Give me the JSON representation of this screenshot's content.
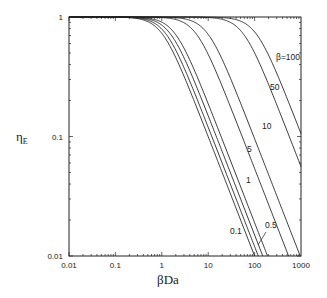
{
  "chart_data": {
    "type": "line",
    "title": "",
    "xlabel": "βDa",
    "ylabel": "ηE",
    "xscale": "log",
    "yscale": "log",
    "xlim": [
      0.01,
      1000
    ],
    "ylim": [
      0.01,
      1
    ],
    "x_ticks": [
      "0.01",
      "0.1",
      "1",
      "10",
      "100",
      "1000"
    ],
    "y_ticks": [
      "0.01",
      "0.1",
      "1"
    ],
    "grid": false,
    "legend": "inline curve labels",
    "series": [
      {
        "name": "β=0.1",
        "label": "0.1",
        "asymptote_C": 1.0,
        "points": [
          [
            0.01,
            1.0
          ],
          [
            0.1,
            0.99
          ],
          [
            1,
            0.62
          ],
          [
            10,
            0.1
          ],
          [
            100,
            0.01
          ]
        ]
      },
      {
        "name": "β=0.3",
        "label": "",
        "asymptote_C": 1.2,
        "points": [
          [
            0.01,
            1.0
          ],
          [
            0.1,
            0.99
          ],
          [
            1,
            0.68
          ],
          [
            10,
            0.12
          ],
          [
            120,
            0.01
          ]
        ]
      },
      {
        "name": "β=0.5",
        "label": "0.5",
        "asymptote_C": 1.5,
        "points": [
          [
            0.01,
            1.0
          ],
          [
            0.1,
            1.0
          ],
          [
            1,
            0.75
          ],
          [
            10,
            0.15
          ],
          [
            150,
            0.01
          ]
        ]
      },
      {
        "name": "β=1",
        "label": "1",
        "asymptote_C": 1.9,
        "points": [
          [
            0.01,
            1.0
          ],
          [
            0.1,
            1.0
          ],
          [
            1,
            0.82
          ],
          [
            10,
            0.19
          ],
          [
            190,
            0.01
          ]
        ]
      },
      {
        "name": "β=5",
        "label": "5",
        "asymptote_C": 5.4,
        "points": [
          [
            0.01,
            1.0
          ],
          [
            1,
            0.98
          ],
          [
            10,
            0.5
          ],
          [
            100,
            0.054
          ],
          [
            540,
            0.01
          ]
        ]
      },
      {
        "name": "β=10",
        "label": "10",
        "asymptote_C": 9.6,
        "points": [
          [
            0.01,
            1.0
          ],
          [
            1,
            1.0
          ],
          [
            10,
            0.7
          ],
          [
            100,
            0.096
          ],
          [
            960,
            0.01
          ]
        ]
      },
      {
        "name": "β=50",
        "label": "50",
        "asymptote_C": 56,
        "points": [
          [
            0.01,
            1.0
          ],
          [
            10,
            1.0
          ],
          [
            100,
            0.5
          ],
          [
            1000,
            0.056
          ]
        ]
      },
      {
        "name": "β=100",
        "label": "β=100",
        "asymptote_C": 106,
        "points": [
          [
            0.01,
            1.0
          ],
          [
            10,
            1.0
          ],
          [
            100,
            0.75
          ],
          [
            1000,
            0.106
          ]
        ]
      }
    ]
  },
  "labels": {
    "x_axis_title": "βDa",
    "y_axis_title_main": "η",
    "y_axis_title_sub": "E",
    "curve_labels": [
      {
        "text": "β=100",
        "x": 276,
        "y": 60
      },
      {
        "text": "50",
        "x": 270,
        "y": 90
      },
      {
        "text": "10",
        "x": 262,
        "y": 129
      },
      {
        "text": "5",
        "x": 247,
        "y": 152
      },
      {
        "text": "1",
        "x": 246,
        "y": 183
      },
      {
        "text": "0.1",
        "x": 230,
        "y": 234
      },
      {
        "text": "0.5",
        "x": 265,
        "y": 228
      }
    ]
  }
}
